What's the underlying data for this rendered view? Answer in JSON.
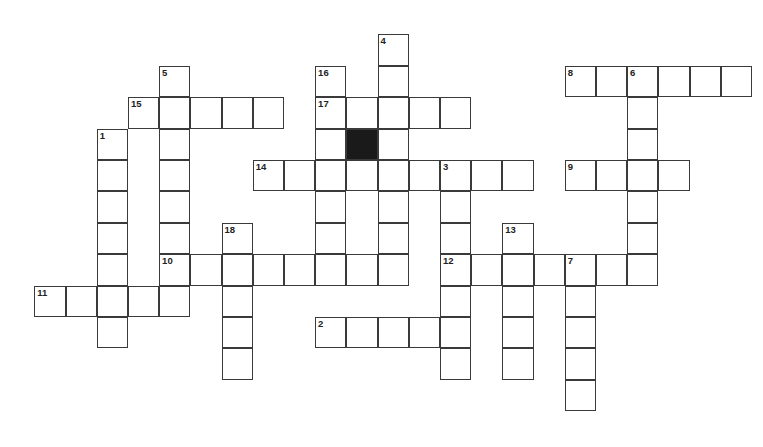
{
  "puzzle": {
    "grid": {
      "origin_x": 35,
      "origin_y": 35,
      "cell_w": 31.2,
      "cell_h": 31.4,
      "border_color": "#3a3a3a",
      "block_color": "#1a1a1a"
    },
    "entries": [
      {
        "number": "1",
        "direction": "down",
        "col": 2,
        "row": 3,
        "length": 7
      },
      {
        "number": "2",
        "direction": "across",
        "col": 9,
        "row": 9,
        "length": 5
      },
      {
        "number": "3",
        "direction": "down",
        "col": 13,
        "row": 4,
        "length": 7
      },
      {
        "number": "4",
        "direction": "down",
        "col": 11,
        "row": 0,
        "length": 8
      },
      {
        "number": "5",
        "direction": "down",
        "col": 4,
        "row": 1,
        "length": 8
      },
      {
        "number": "6",
        "direction": "down",
        "col": 19,
        "row": 1,
        "length": 7
      },
      {
        "number": "7",
        "direction": "down",
        "col": 17,
        "row": 7,
        "length": 5
      },
      {
        "number": "8",
        "direction": "across",
        "col": 17,
        "row": 1,
        "length": 6
      },
      {
        "number": "9",
        "direction": "across",
        "col": 17,
        "row": 4,
        "length": 4
      },
      {
        "number": "10",
        "direction": "across",
        "col": 4,
        "row": 7,
        "length": 8
      },
      {
        "number": "11",
        "direction": "across",
        "col": 0,
        "row": 8,
        "length": 5
      },
      {
        "number": "12",
        "direction": "across",
        "col": 13,
        "row": 7,
        "length": 7
      },
      {
        "number": "13",
        "direction": "down",
        "col": 15,
        "row": 6,
        "length": 5
      },
      {
        "number": "14",
        "direction": "across",
        "col": 7,
        "row": 4,
        "length": 9
      },
      {
        "number": "15",
        "direction": "across",
        "col": 3,
        "row": 2,
        "length": 5
      },
      {
        "number": "16",
        "direction": "down",
        "col": 9,
        "row": 1,
        "length": 7
      },
      {
        "number": "17",
        "direction": "across",
        "col": 9,
        "row": 2,
        "length": 5
      },
      {
        "number": "18",
        "direction": "down",
        "col": 6,
        "row": 6,
        "length": 5
      }
    ],
    "blocks": [
      {
        "col": 10,
        "row": 3
      }
    ]
  }
}
